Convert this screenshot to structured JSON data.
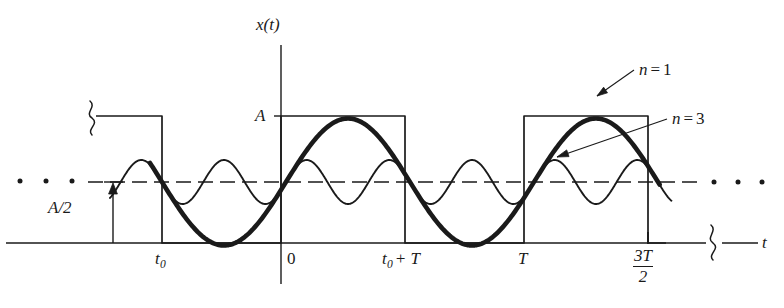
{
  "figure": {
    "type": "line",
    "axis": {
      "y_axis_label": "x(t)",
      "x_axis_label": "t",
      "amplitude_label": "A",
      "offset_label_numerator": "A",
      "offset_label_denominator": "2",
      "offset_label": "A/2"
    },
    "x_ticks": [
      {
        "name": "t0",
        "label_base": "t",
        "label_sub": "0",
        "label": "t0"
      },
      {
        "name": "origin",
        "label": "0"
      },
      {
        "name": "t0-plus-T",
        "label_base": "t",
        "label_sub": "0",
        "label_rest": "+ T",
        "label": "t0 + T"
      },
      {
        "name": "T",
        "label": "T"
      },
      {
        "name": "three-halves-T",
        "label_numerator": "3T",
        "label_denominator": "2",
        "label": "3T/2"
      }
    ],
    "annotations": [
      {
        "name": "harmonic-n1",
        "label": "n = 1",
        "label_var": "n",
        "label_eq": "=",
        "label_val": "1"
      },
      {
        "name": "harmonic-n3",
        "label": "n = 3",
        "label_var": "n",
        "label_eq": "=",
        "label_val": "3"
      }
    ],
    "ellipsis": {
      "left": "...",
      "right": "..."
    },
    "colors": {
      "ink": "#1a1a1a",
      "thin_line": "#2b2b2b",
      "background": "#ffffff"
    }
  },
  "chart_data": {
    "type": "line",
    "title": "",
    "xlabel": "t",
    "ylabel": "x(t)",
    "grid": false,
    "legend": [
      "n = 1",
      "n = 3"
    ],
    "legend_position": "annotations-with-arrows",
    "x_tick_labels": [
      "t0",
      "0",
      "t0 + T",
      "T",
      "3T/2"
    ],
    "y_tick_labels": [
      "A",
      "A/2"
    ],
    "ylim": [
      0,
      1.18
    ],
    "series": [
      {
        "name": "square-wave",
        "style": "thin-solid",
        "description": "periodic rectangular pulse train, amplitude A, 50% duty cycle, period T, rising edge at t0",
        "levels": [
          0,
          1
        ],
        "duty_cycle": 0.5
      },
      {
        "name": "n = 1",
        "style": "thick-solid",
        "description": "first harmonic (fundamental) sinusoid about the A/2 mean level",
        "amplitude": 0.5,
        "mean": 0.5,
        "periods_shown": 2
      },
      {
        "name": "n = 3",
        "style": "thin-solid",
        "description": "third harmonic sinusoid about the A/2 mean level",
        "amplitude": 0.18,
        "mean": 0.5,
        "periods_shown": 6
      }
    ]
  }
}
